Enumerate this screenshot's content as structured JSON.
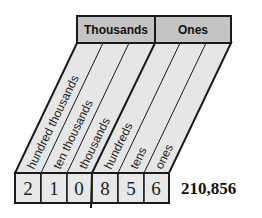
{
  "periods": [
    {
      "label": "Thousands"
    },
    {
      "label": "Ones"
    }
  ],
  "columns": [
    {
      "label": "hundred thousands",
      "digit": "2"
    },
    {
      "label": "ten thousands",
      "digit": "1"
    },
    {
      "label": "thousands",
      "digit": "0"
    },
    {
      "label": "hundreds",
      "digit": "8"
    },
    {
      "label": "tens",
      "digit": "5"
    },
    {
      "label": "ones",
      "digit": "6"
    }
  ],
  "number": "210,856",
  "colors": {
    "header_fill": "#c4c4c4",
    "column_fill": "#e6e6e6",
    "box_fill": "#e8e8e8",
    "stroke": "#1a1a1a"
  }
}
